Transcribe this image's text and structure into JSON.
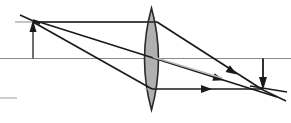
{
  "figure": {
    "type": "optics-ray-diagram",
    "width": 291,
    "height": 123,
    "background_color": "#ffffff"
  },
  "colors": {
    "ray_stroke": "#1a1a1a",
    "axis_stroke": "#8a8a8a",
    "faint_stroke": "#b9b9b9",
    "lens_fill": "#b0b0b0",
    "lens_stroke": "#2a2a2a",
    "arrow_fill": "#1a1a1a"
  },
  "optical_axis": {
    "label": "optical-axis",
    "x1": 0,
    "y1": 58.5,
    "x2": 291,
    "y2": 58.5,
    "stroke_width": 1.2
  },
  "construction_lines": [
    {
      "name": "object-top-horizontal-ray",
      "x1": 15,
      "y1": 22,
      "x2": 152,
      "y2": 22,
      "stroke": "#8a8a8a",
      "stroke_width": 1.2
    },
    {
      "name": "lower-left-stub",
      "x1": 0,
      "y1": 98,
      "x2": 17,
      "y2": 98,
      "stroke": "#b9b9b9",
      "stroke_width": 1.4
    },
    {
      "name": "image-side-horizontal-guide",
      "x1": 190,
      "y1": 58.5,
      "x2": 291,
      "y2": 58.5,
      "stroke": "#8a8a8a",
      "stroke_width": 1.2
    }
  ],
  "lens": {
    "name": "converging-lens",
    "center_x": 151.5,
    "top_y": 8,
    "bottom_y": 110,
    "half_width": 9,
    "fill": "#b0b0b0",
    "stroke": "#2a2a2a",
    "stroke_width": 1.6
  },
  "object_arrow": {
    "name": "object-arrow",
    "x": 33,
    "tip_y": 20,
    "tail_y": 58.5,
    "direction": "up",
    "stroke": "#4a4a4a",
    "stroke_width": 1.6,
    "head_width": 7,
    "head_length": 12
  },
  "image_arrow": {
    "name": "image-arrow",
    "x": 263,
    "tip_y": 90,
    "tail_y": 58.5,
    "direction": "down",
    "stroke": "#1a1a1a",
    "stroke_width": 1.8,
    "head_width": 8,
    "head_length": 13
  },
  "rays": [
    {
      "name": "ray-parallel-then-through-focus",
      "description": "From object tip parallel to axis, refracts at lens top, converges to image tip",
      "segments": [
        {
          "x1": 33,
          "y1": 22,
          "x2": 157,
          "y2": 22
        },
        {
          "x1": 157,
          "y1": 22,
          "x2": 263,
          "y2": 90
        }
      ],
      "stroke": "#1a1a1a",
      "stroke_width": 1.7,
      "arrowhead_at": {
        "x": 237,
        "y": 74.5,
        "angle_deg": 32.7
      }
    },
    {
      "name": "ray-through-lens-center",
      "description": "From object tip straight through optical center of lens",
      "segments": [
        {
          "x1": 33,
          "y1": 20,
          "x2": 277,
          "y2": 97
        }
      ],
      "stroke": "#1a1a1a",
      "stroke_width": 1.7,
      "arrowhead_at": {
        "x": 224,
        "y": 80.3,
        "angle_deg": 17.5
      }
    },
    {
      "name": "ray-through-focus-then-parallel",
      "description": "From object tip through front focus, refracts at lens bottom, exits parallel to axis",
      "segments": [
        {
          "x1": 33,
          "y1": 22,
          "x2": 152,
          "y2": 89
        },
        {
          "x1": 152,
          "y1": 89,
          "x2": 263,
          "y2": 89
        }
      ],
      "stroke": "#1a1a1a",
      "stroke_width": 1.7,
      "arrowhead_at": {
        "x": 212,
        "y": 89,
        "angle_deg": 0
      }
    },
    {
      "name": "ray-extension-upper-left",
      "description": "Short extension of rays beyond the object tip to upper left",
      "segments": [
        {
          "x1": 20,
          "y1": 15,
          "x2": 40,
          "y2": 24
        }
      ],
      "stroke": "#1a1a1a",
      "stroke_width": 1.5,
      "arrowhead_at": null
    },
    {
      "name": "ray-faint-from-lens-center",
      "description": "Faint gray ray leaving lens centre toward lower right",
      "segments": [
        {
          "x1": 153,
          "y1": 57,
          "x2": 222,
          "y2": 78
        }
      ],
      "stroke": "#b9b9b9",
      "stroke_width": 1.6,
      "arrowhead_at": null
    },
    {
      "name": "ray-extension-lower-right",
      "description": "Extension past the image point toward lower right",
      "segments": [
        {
          "x1": 263,
          "y1": 90,
          "x2": 286,
          "y2": 101
        }
      ],
      "stroke": "#1a1a1a",
      "stroke_width": 1.4,
      "arrowhead_at": null
    },
    {
      "name": "ray-crossing-stub-right",
      "description": "Short stub crossing the image point to the right",
      "segments": [
        {
          "x1": 250,
          "y1": 86,
          "x2": 287,
          "y2": 92
        }
      ],
      "stroke": "#1a1a1a",
      "stroke_width": 1.3,
      "arrowhead_at": null
    }
  ]
}
